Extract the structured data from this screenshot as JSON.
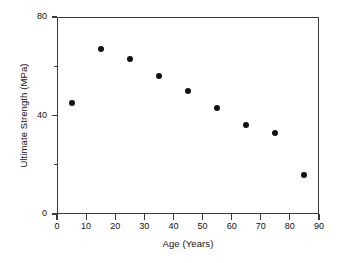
{
  "chart_data": {
    "type": "scatter",
    "title": "",
    "xlabel": "Age (Years)",
    "ylabel": "Ultimate Strength (MPa)",
    "xlim": [
      0,
      90
    ],
    "ylim": [
      0,
      80
    ],
    "xticks": [
      0,
      10,
      20,
      30,
      40,
      50,
      60,
      70,
      80,
      90
    ],
    "xticklabels": [
      "0",
      "10",
      "20",
      "30",
      "40",
      "50",
      "60",
      "70",
      "80",
      "90"
    ],
    "yticks": [
      0,
      40,
      80
    ],
    "yticklabels": [
      "0",
      "40",
      "80"
    ],
    "y_minor_ticks": [
      20,
      60
    ],
    "grid": false,
    "legend": null,
    "marker": {
      "shape": "circle",
      "color": "#111111",
      "size": 6
    },
    "series": [
      {
        "name": "Ultimate Strength vs Age",
        "x": [
          5,
          15,
          25,
          35,
          45,
          55,
          65,
          75,
          85
        ],
        "y": [
          45,
          67,
          63,
          56,
          50,
          43,
          36,
          33,
          16
        ]
      }
    ]
  },
  "axes": {
    "x_title": "Age (Years)",
    "y_title": "Ultimate Strength (MPa)"
  }
}
